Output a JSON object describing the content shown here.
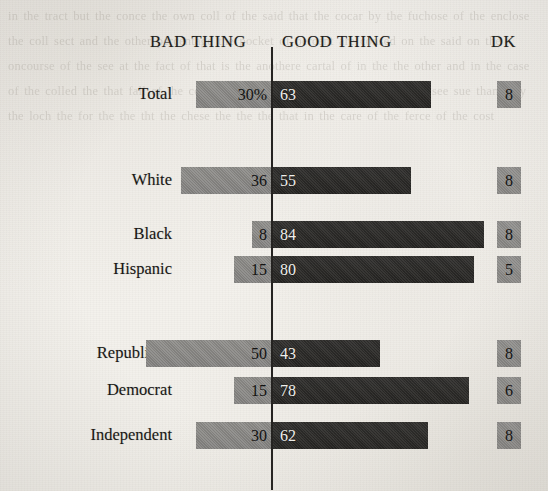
{
  "headers": {
    "bad": "BAD THING",
    "good": "GOOD THING",
    "dk": "DK"
  },
  "colors": {
    "bad_bar": "#8b8a87",
    "good_bar": "#2c2b29",
    "dk_box": "#8f8e8b",
    "axis": "#242220",
    "paper": "#f5f3ef",
    "text": "#171614"
  },
  "bleed_text": "in the tract but the conce the own coll of the said that the cocar by the fuchose of the enclose the coll sect and the other percentage the pocket of percent are consed on the said on the oncourse of the see at the fact of that is the anothere cartal of in the the other and in the case of the colled the that fall of the cornt the ther the the cheng of or each bod see sue than they the loch the for the the tht the chese the the the that in the care of the ferce of the cost",
  "chart_data": {
    "type": "bar",
    "subtype": "diverging-stacked-bar",
    "title": "",
    "xlabel": "",
    "ylabel": "",
    "grid": false,
    "legend_position": "top",
    "axis_center_value": 0,
    "value_unit": "percent",
    "px_per_unit": 2.52,
    "series": [
      {
        "name": "BAD THING",
        "direction": "left",
        "color": "#8b8a87",
        "values": [
          30,
          null,
          36,
          8,
          15,
          null,
          50,
          15,
          30
        ]
      },
      {
        "name": "GOOD THING",
        "direction": "right",
        "color": "#2c2b29",
        "values": [
          63,
          null,
          55,
          84,
          80,
          null,
          43,
          78,
          62
        ]
      },
      {
        "name": "DK",
        "direction": "box",
        "color": "#8f8e8b",
        "values": [
          8,
          null,
          8,
          8,
          5,
          null,
          8,
          6,
          8
        ]
      }
    ],
    "categories": [
      "Total",
      "",
      "White",
      "Black",
      "Hispanic",
      "",
      "Republican",
      "Democrat",
      "Independent"
    ],
    "rows": [
      {
        "label": "Total",
        "bad": 30,
        "bad_label": "30%",
        "good": 63,
        "good_label": "63",
        "dk": 8,
        "dk_label": "8",
        "top": 81,
        "spacer": false
      },
      {
        "label": "White",
        "bad": 36,
        "bad_label": "36",
        "good": 55,
        "good_label": "55",
        "dk": 8,
        "dk_label": "8",
        "top": 167,
        "spacer": false
      },
      {
        "label": "Black",
        "bad": 8,
        "bad_label": "8",
        "good": 84,
        "good_label": "84",
        "dk": 8,
        "dk_label": "8",
        "top": 221,
        "spacer": false
      },
      {
        "label": "Hispanic",
        "bad": 15,
        "bad_label": "15",
        "good": 80,
        "good_label": "80",
        "dk": 5,
        "dk_label": "5",
        "top": 256,
        "spacer": false
      },
      {
        "label": "Republican",
        "bad": 50,
        "bad_label": "50",
        "good": 43,
        "good_label": "43",
        "dk": 8,
        "dk_label": "8",
        "top": 340,
        "spacer": false
      },
      {
        "label": "Democrat",
        "bad": 15,
        "bad_label": "15",
        "good": 78,
        "good_label": "78",
        "dk": 6,
        "dk_label": "6",
        "top": 377,
        "spacer": false
      },
      {
        "label": "Independent",
        "bad": 30,
        "bad_label": "30",
        "good": 62,
        "good_label": "62",
        "dk": 8,
        "dk_label": "8",
        "top": 422,
        "spacer": false
      }
    ]
  }
}
